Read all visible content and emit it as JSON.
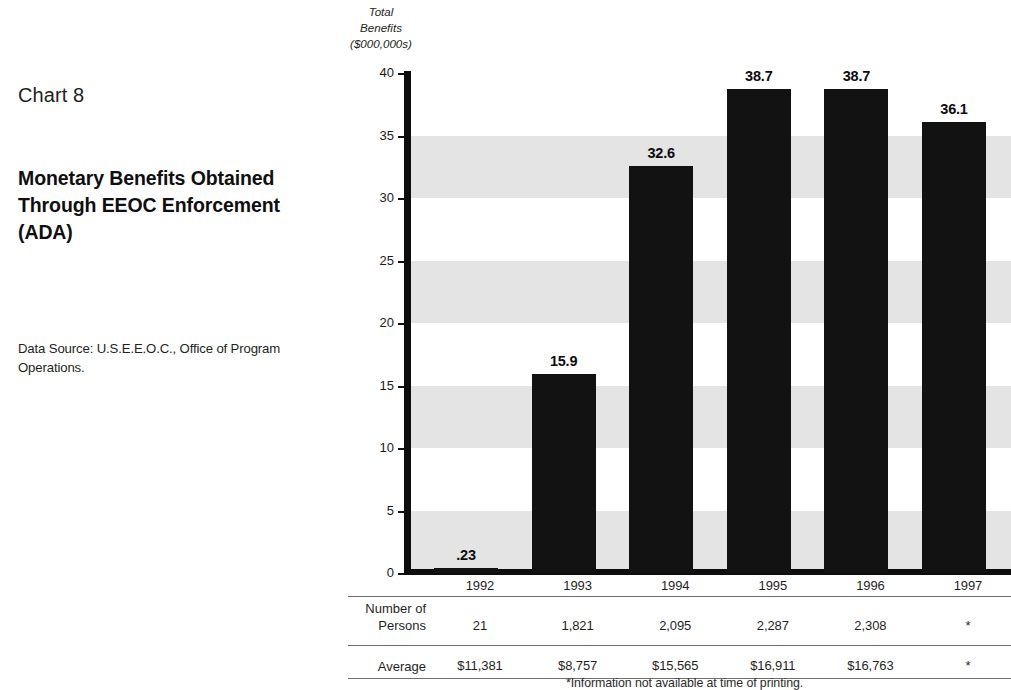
{
  "left_panel": {
    "chart_number": "Chart 8",
    "title": "Monetary Benefits Obtained Through EEOC Enforcement (ADA)",
    "data_source": "Data Source: U.S.E.E.O.C., Office of Program Operations."
  },
  "footnote": "*Information not available at time of printing.",
  "colors": {
    "bar": "#121212",
    "band": "#e4e4e4",
    "axis": "#0d0d0d",
    "text": "#1f1f1f"
  },
  "chart_data": {
    "type": "bar",
    "title": "Monetary Benefits Obtained Through EEOC Enforcement (ADA)",
    "ylabel": "Total Benefits ($000,000s)",
    "ylabel_lines": [
      "Total",
      "Benefits",
      "($000,000s)"
    ],
    "xlabel": "",
    "ylim": [
      0,
      40
    ],
    "yticks": [
      0,
      5,
      10,
      15,
      20,
      25,
      30,
      35,
      40
    ],
    "ytick_labels": [
      "0",
      "5",
      "10",
      "15",
      "20",
      "25",
      "30",
      "35",
      "40"
    ],
    "grid": false,
    "banded_background": true,
    "bands": [
      [
        0,
        5
      ],
      [
        10,
        15
      ],
      [
        20,
        25
      ],
      [
        30,
        35
      ]
    ],
    "legend": null,
    "categories": [
      "1992",
      "1993",
      "1994",
      "1995",
      "1996",
      "1997"
    ],
    "values": [
      0.23,
      15.9,
      32.6,
      38.7,
      38.7,
      36.1
    ],
    "data_labels": [
      ".23",
      "15.9",
      "32.6",
      "38.7",
      "38.7",
      "36.1"
    ]
  },
  "table": {
    "columns": [
      "1992",
      "1993",
      "1994",
      "1995",
      "1996",
      "1997"
    ],
    "rows": [
      {
        "label": "Number of Persons",
        "label_lines": [
          "Number of",
          "Persons"
        ],
        "values": [
          "21",
          "1,821",
          "2,095",
          "2,287",
          "2,308",
          "*"
        ]
      },
      {
        "label": "Average",
        "label_lines": [
          "Average"
        ],
        "values": [
          "$11,381",
          "$8,757",
          "$15,565",
          "$16,911",
          "$16,763",
          "*"
        ]
      }
    ]
  }
}
